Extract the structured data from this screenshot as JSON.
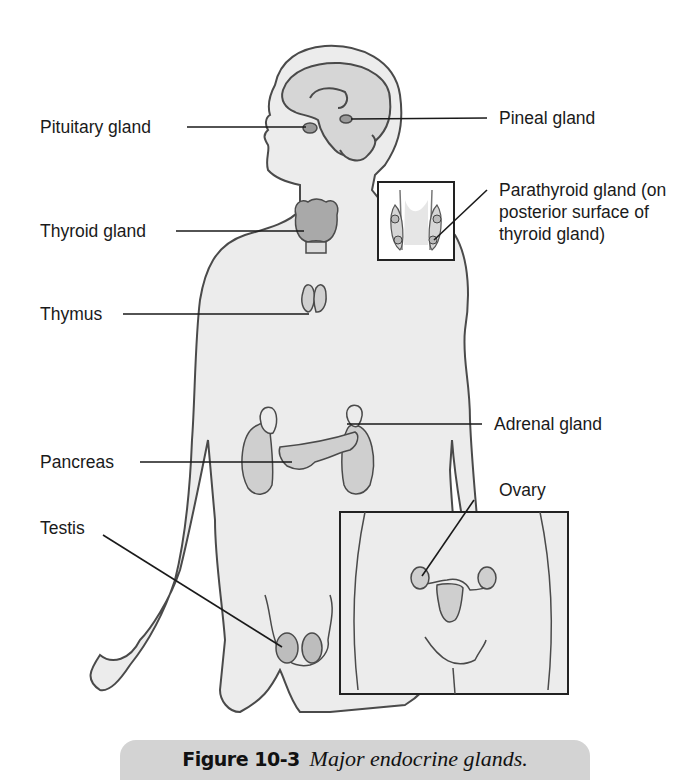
{
  "figure": {
    "title": "Major endocrine glands",
    "labels": {
      "pituitary": "Pituitary gland",
      "pineal": "Pineal gland",
      "parathyroid": "Parathyroid gland (on posterior surface of thyroid gland)",
      "thyroid": "Thyroid gland",
      "thymus": "Thymus",
      "adrenal": "Adrenal gland",
      "pancreas": "Pancreas",
      "ovary": "Ovary",
      "testis": "Testis"
    },
    "insets": [
      {
        "name": "parathyroid-inset",
        "depicts": "posterior view of thyroid with four parathyroid glands"
      },
      {
        "name": "ovary-inset",
        "depicts": "female pelvis with uterus and ovaries"
      }
    ]
  },
  "caption": {
    "number": "Figure 10-3",
    "text": "Major endocrine glands."
  },
  "colors": {
    "skin": "#ececec",
    "gland": "#cfcfcf",
    "thyroid": "#a9a9a9",
    "outline": "#4a4a4a",
    "leader_line": "#1a1a1a",
    "caption_bar": "#d3d3d3"
  }
}
